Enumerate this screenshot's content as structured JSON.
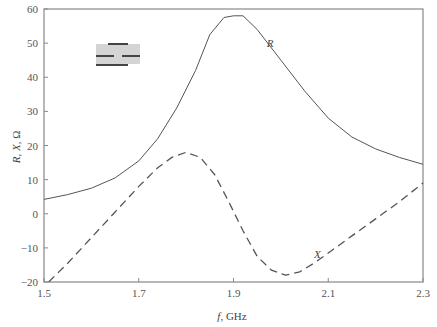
{
  "chart_data": {
    "type": "line",
    "title": "",
    "xlabel": "f, GHz",
    "xlabel_italic_part": "f",
    "xlabel_rest": ", GHz",
    "ylabel": "R, X, Ω",
    "ylabel_parts": [
      "R",
      ", ",
      "X",
      ", Ω"
    ],
    "xlim": [
      1.5,
      2.3
    ],
    "ylim": [
      -20,
      60
    ],
    "grid": false,
    "legend": "none (inline curve labels)",
    "x_ticks": [
      1.5,
      1.7,
      1.9,
      2.1,
      2.3
    ],
    "x_tick_labels": [
      "1.5",
      "1.7",
      "1.9",
      "2.1",
      "2.3"
    ],
    "y_ticks": [
      -20,
      -10,
      0,
      10,
      20,
      30,
      40,
      50,
      60
    ],
    "y_tick_labels": [
      "−20",
      "−10",
      "0",
      "10",
      "20",
      "30",
      "40",
      "50",
      "60"
    ],
    "series": [
      {
        "name": "R",
        "style": "solid",
        "label_position": [
          1.97,
          49
        ],
        "x": [
          1.5,
          1.55,
          1.6,
          1.65,
          1.7,
          1.74,
          1.78,
          1.82,
          1.85,
          1.88,
          1.9,
          1.92,
          1.95,
          2.0,
          2.05,
          2.1,
          2.15,
          2.2,
          2.25,
          2.3
        ],
        "values": [
          4.2,
          5.6,
          7.5,
          10.5,
          15.5,
          22,
          31,
          42,
          52.5,
          57.5,
          58,
          58,
          54,
          45,
          36,
          28,
          22.5,
          19,
          16.5,
          14.5
        ]
      },
      {
        "name": "X",
        "style": "dashed",
        "label_position": [
          2.07,
          -13
        ],
        "x": [
          1.51,
          1.55,
          1.6,
          1.65,
          1.7,
          1.74,
          1.77,
          1.8,
          1.83,
          1.86,
          1.89,
          1.92,
          1.95,
          1.98,
          2.01,
          2.04,
          2.07,
          2.1,
          2.15,
          2.2,
          2.25,
          2.3
        ],
        "values": [
          -20,
          -14.5,
          -7,
          0.5,
          8,
          13.5,
          16.5,
          18,
          16.5,
          11.5,
          3.5,
          -5,
          -12.5,
          -16.5,
          -18,
          -17,
          -14.5,
          -11.5,
          -6.5,
          -1.5,
          3.5,
          9
        ]
      }
    ],
    "inset_icon": "strip-line-resonator-schematic"
  },
  "colors": {
    "axis": "#888888",
    "curve": "#555555",
    "inset_fill": "#d4d4d4",
    "inset_strip": "#444444"
  }
}
